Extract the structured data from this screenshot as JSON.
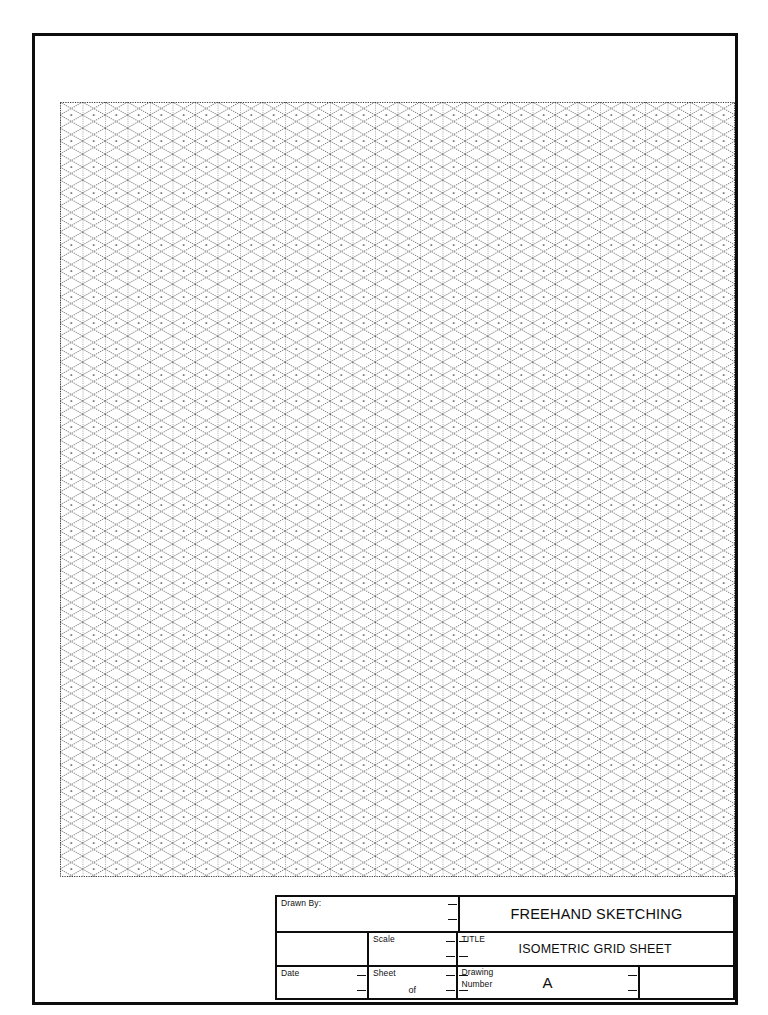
{
  "document": {
    "type": "isometric-grid-sheet",
    "sheet_size": "A",
    "background_color": "#ffffff",
    "border_color": "#0d0d0d"
  },
  "grid": {
    "name": "isometric-grid",
    "style": "dotted",
    "line_color": "#555555",
    "cell_width": 22.5,
    "cell_height": 26,
    "angle_degrees": 30,
    "columns": 30,
    "rows": 30,
    "left": 60,
    "top": 102,
    "width": 675,
    "height": 775
  },
  "title_block": {
    "drawn_by_label": "Drawn By:",
    "scale_label": "Scale",
    "date_label": "Date",
    "sheet_label": "Sheet",
    "sheet_of_label": "of",
    "title_label": "TITLE",
    "drawing_number_label_line1": "Drawing",
    "drawing_number_label_line2": "Number",
    "main_title": "FREEHAND SKETCHING",
    "sub_title": "ISOMETRIC GRID SHEET",
    "drawing_number_value": "A",
    "drawn_by_value": "",
    "scale_value": "",
    "date_value": "",
    "sheet_value": "",
    "sheet_total_value": "",
    "revision_value": ""
  }
}
